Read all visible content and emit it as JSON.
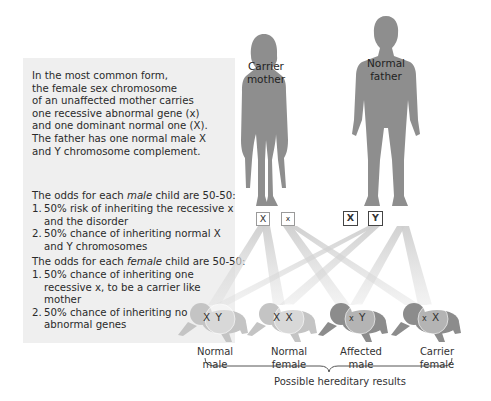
{
  "intro_text": [
    "In the most common form,",
    "the female sex chromosome",
    "of an unaffected mother carries",
    "one recessive abnormal gene (x)",
    "and one dominant normal one (X).",
    "The father has one normal male X",
    "and Y chromosome complement."
  ],
  "male_odds": {
    "heading_pre": "The odds for each ",
    "heading_em": "male",
    "heading_post": " child are 50-50:",
    "items": [
      {
        "num": "1.",
        "lines": [
          "50% risk of inheriting the recessive x",
          "and the disorder"
        ]
      },
      {
        "num": "2.",
        "lines": [
          "50% chance of inheriting normal X",
          "and Y chromosomes"
        ]
      }
    ]
  },
  "female_odds": {
    "heading_pre": "The odds for each ",
    "heading_em": "female",
    "heading_post": " child are 50-50:",
    "items": [
      {
        "num": "1.",
        "lines": [
          "50% chance of inheriting one",
          "recessive x, to be a carrier like",
          "mother"
        ]
      },
      {
        "num": "2.",
        "lines": [
          "50% chance of  inheriting no",
          "abnormal genes"
        ]
      }
    ]
  },
  "parents": {
    "mother": {
      "label_line1": "Carrier",
      "label_line2": "mother",
      "chromosomes": [
        "X",
        "x"
      ]
    },
    "father": {
      "label_line1": "Normal",
      "label_line2": "father",
      "chromosomes": [
        "X",
        "Y"
      ]
    }
  },
  "children": [
    {
      "chromosomes": [
        "X",
        "Y"
      ],
      "label_line1": "Normal",
      "label_line2": "male"
    },
    {
      "chromosomes": [
        "X",
        "X"
      ],
      "label_line1": "Normal",
      "label_line2": "female"
    },
    {
      "chromosomes": [
        "x",
        "Y"
      ],
      "label_line1": "Affected",
      "label_line2": "male"
    },
    {
      "chromosomes": [
        "x",
        "X"
      ],
      "label_line1": "Carrier",
      "label_line2": "female"
    }
  ],
  "results_label": "Possible hereditary results",
  "colors": {
    "panel_bg": "#efefef",
    "silhouette": "#8e8e8e",
    "light_child": "#c4c4c4",
    "dark_child": "#8c8c8c",
    "beam": "#d2d2d2"
  }
}
